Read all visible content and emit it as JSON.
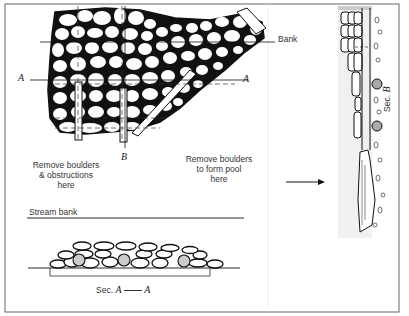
{
  "diagram": {
    "labels": {
      "bank": "Bank",
      "section_a_left": "A",
      "section_a_right": "A",
      "section_b": "B",
      "remove_obstructions": [
        "Remove boulders",
        "& obstructions",
        "here"
      ],
      "remove_pool": [
        "Remove boulders",
        "to form pool",
        "here"
      ],
      "stream_bank": "Stream bank",
      "sec_aa_prefix": "Sec.",
      "sec_aa_a1": "A",
      "sec_aa_a2": "A",
      "sec_b_prefix": "Sec.",
      "sec_b_letter": "B"
    },
    "views": [
      {
        "name": "plan-view",
        "description": "Plan of boulder-filled stream reach with section lines A-A and B"
      },
      {
        "name": "section-a-a",
        "description": "Cross section A-A showing boulder layer on streambed"
      },
      {
        "name": "section-b",
        "description": "Longitudinal section B with flow arrow"
      }
    ],
    "colors": {
      "ink": "#1a1a1a",
      "paper": "#ffffff",
      "frame": "#555555"
    }
  }
}
